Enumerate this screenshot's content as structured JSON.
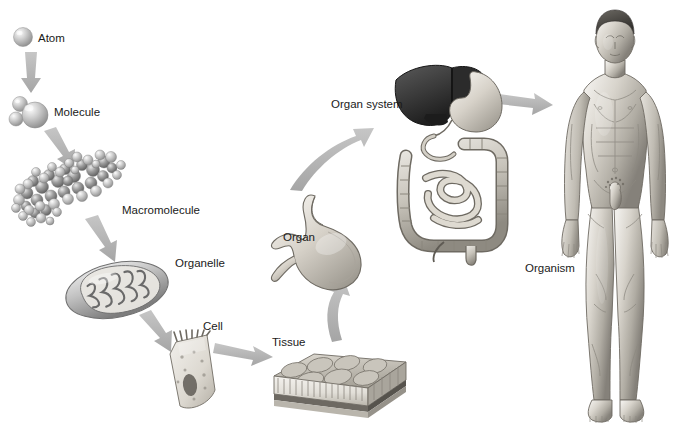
{
  "diagram": {
    "type": "hierarchy-flow",
    "background_color": "#ffffff",
    "label_color": "#1a1a1a",
    "arrow_color": "#b3b3b3"
  },
  "levels": [
    {
      "id": "atom",
      "label": "Atom",
      "label_x": 38,
      "label_y": 40,
      "icon": "sphere-atom-icon",
      "depicts": "single gray sphere"
    },
    {
      "id": "molecule",
      "label": "Molecule",
      "label_x": 54,
      "label_y": 114,
      "icon": "water-molecule-icon",
      "depicts": "water molecule, one large and two small spheres"
    },
    {
      "id": "macromolecule",
      "label": "Macromolecule",
      "label_x": 122,
      "label_y": 212,
      "icon": "protein-spacefill-icon",
      "depicts": "space-filling protein model"
    },
    {
      "id": "organelle",
      "label": "Organelle",
      "label_x": 175,
      "label_y": 268,
      "icon": "mitochondrion-icon",
      "depicts": "mitochondrion with cristae"
    },
    {
      "id": "cell",
      "label": "Cell",
      "label_x": 203,
      "label_y": 328,
      "icon": "epithelial-cell-icon",
      "depicts": "columnar cell with microvilli and nucleus"
    },
    {
      "id": "tissue",
      "label": "Tissue",
      "label_x": 272,
      "label_y": 345,
      "icon": "epithelial-tissue-icon",
      "depicts": "block of epithelial tissue"
    },
    {
      "id": "organ",
      "label": "Organ",
      "label_x": 283,
      "label_y": 240,
      "icon": "stomach-icon",
      "depicts": "stomach"
    },
    {
      "id": "organ_system",
      "label": "Organ system",
      "label_x": 331,
      "label_y": 106,
      "icon": "digestive-system-icon",
      "depicts": "digestive system: liver, stomach, small and large intestine"
    },
    {
      "id": "organism",
      "label": "Organism",
      "label_x": 525,
      "label_y": 272,
      "icon": "human-body-icon",
      "depicts": "full male human figure, anterior view"
    }
  ],
  "arrows": [
    {
      "id": "atom-to-molecule",
      "from": "atom",
      "to": "molecule",
      "direction": "down"
    },
    {
      "id": "molecule-to-macromolecule",
      "from": "molecule",
      "to": "macromolecule",
      "direction": "down-right"
    },
    {
      "id": "macromolecule-to-organelle",
      "from": "macromolecule",
      "to": "organelle",
      "direction": "down-right"
    },
    {
      "id": "organelle-to-cell",
      "from": "organelle",
      "to": "cell",
      "direction": "down-right"
    },
    {
      "id": "cell-to-tissue",
      "from": "cell",
      "to": "tissue",
      "direction": "right"
    },
    {
      "id": "tissue-to-organ",
      "from": "tissue",
      "to": "organ",
      "direction": "up"
    },
    {
      "id": "organ-to-organ-system",
      "from": "organ",
      "to": "organ_system",
      "direction": "up-right"
    },
    {
      "id": "organ-system-to-organism",
      "from": "organ_system",
      "to": "organism",
      "direction": "right"
    }
  ]
}
